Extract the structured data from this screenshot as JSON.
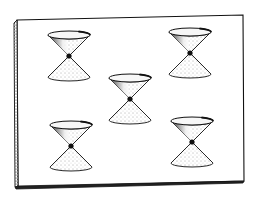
{
  "figure": {
    "background": "#ffffff",
    "ink": "#111111",
    "slab": {
      "top_left": [
        17,
        20
      ],
      "top_right": [
        243,
        15
      ],
      "bottom_right": [
        244,
        181
      ],
      "bottom_left": [
        18,
        187
      ],
      "left_edge_thickness": 4,
      "bottom_edge_thickness": 2
    },
    "cone_style": {
      "half_width": 21,
      "half_height": 21,
      "ellipse_ry": 4,
      "apex_radius": 2.6
    },
    "cones": [
      {
        "id": "top-left",
        "apex": [
          69,
          56
        ]
      },
      {
        "id": "top-right",
        "apex": [
          190,
          53
        ]
      },
      {
        "id": "center",
        "apex": [
          130,
          99
        ]
      },
      {
        "id": "bottom-left",
        "apex": [
          71,
          146
        ]
      },
      {
        "id": "bottom-right",
        "apex": [
          192,
          142
        ]
      }
    ]
  }
}
